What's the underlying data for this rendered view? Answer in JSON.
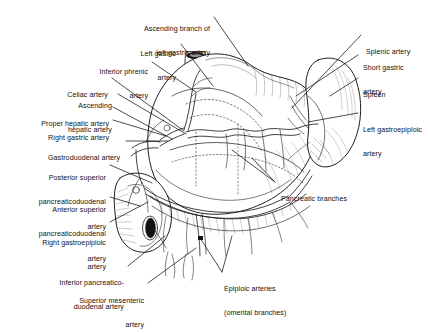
{
  "figure": {
    "style": "black-and-white line-art anatomical illustration with leader lines",
    "background_color": "#ffffff",
    "ink_color": "#1a1a1a"
  },
  "labels_left": [
    {
      "name": "ascending-branch-left-gastric",
      "lines": [
        "Ascending branch of",
        "left gastric artery"
      ]
    },
    {
      "name": "left-gastric-artery",
      "lines": [
        "Left gastric",
        "artery"
      ]
    },
    {
      "name": "inferior-phrenic-artery",
      "lines": [
        "Inferior phrenic",
        "artery"
      ]
    },
    {
      "name": "celiac-artery",
      "lines": [
        "Celiac artery"
      ]
    },
    {
      "name": "ascending-hepatic-artery",
      "lines": [
        "Ascending",
        "hepatic artery"
      ]
    },
    {
      "name": "proper-hepatic-artery",
      "lines": [
        "Proper hepatic artery"
      ]
    },
    {
      "name": "right-gastric-artery",
      "lines": [
        "Right gastric artery"
      ]
    },
    {
      "name": "gastroduodenal-artery",
      "lines": [
        "Gastroduodenal artery"
      ]
    },
    {
      "name": "posterior-superior-pancreaticoduodenal-artery",
      "lines": [
        "Posterior superior",
        "pancreaticoduodenal",
        "artery"
      ]
    },
    {
      "name": "anterior-superior-pancreaticoduodenal-artery",
      "lines": [
        "Anterior superior",
        "pancreaticoduodenal",
        "artery"
      ]
    },
    {
      "name": "right-gastroepiploic-artery",
      "lines": [
        "Right gastroepiploic",
        "artery"
      ]
    },
    {
      "name": "inferior-pancreaticoduodenal-artery",
      "lines": [
        "Inferior pancreatico-",
        "duodenal artery"
      ]
    },
    {
      "name": "superior-mesenteric-artery",
      "lines": [
        "Superior mesenteric",
        "artery"
      ]
    }
  ],
  "labels_right": [
    {
      "name": "splenic-artery",
      "lines": [
        "Splenic artery"
      ]
    },
    {
      "name": "short-gastric-artery",
      "lines": [
        "Short gastric",
        "artery"
      ]
    },
    {
      "name": "spleen",
      "lines": [
        "Spleen"
      ]
    },
    {
      "name": "left-gastroepiploic-artery",
      "lines": [
        "Left gastroepiploic",
        "artery"
      ]
    },
    {
      "name": "pancreatic-branches",
      "lines": [
        "Pancreatic branches"
      ]
    },
    {
      "name": "epiploic-arteries",
      "lines": [
        "Epiploic arteries",
        "(omental branches)"
      ]
    }
  ],
  "anatomy_depicted": [
    "esophagus stump",
    "stomach (fundus, body, greater and lesser curvature)",
    "spleen",
    "pancreas",
    "duodenum",
    "greater omentum"
  ]
}
